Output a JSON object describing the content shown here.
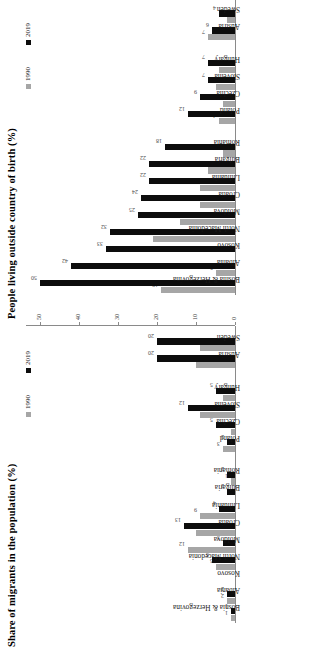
{
  "figure": {
    "orientation": "rotated-90-ccw",
    "colors": {
      "series_1990": "#a6a6a6",
      "series_2019": "#0d0d0d",
      "axis": "#8a8a8a",
      "text": "#1a1a1a"
    }
  },
  "legend": {
    "series_1990": "1990",
    "series_2019": "2019"
  },
  "chart_data": [
    {
      "type": "bar",
      "id": "people-living-outside-country-of-birth",
      "title": "People living outside country of birth (%)",
      "xlabel": "",
      "ylabel": "",
      "ylim": [
        0,
        50
      ],
      "yticks": [
        "0",
        "20",
        "40"
      ],
      "grid": false,
      "legend_position": "top-right",
      "categories": [
        "Bosnia & Herzegovina",
        "Albania",
        "Kosovo",
        "North Macedonia",
        "Moldova",
        "Croatia",
        "Lithuania",
        "Bulgaria",
        "Romania",
        "Poland",
        "Czechia",
        "Slovenia",
        "Hungary",
        "Austria",
        "Sweden"
      ],
      "group_breaks": [
        9,
        13
      ],
      "series": [
        {
          "name": "1990",
          "values": [
            19,
            5,
            null,
            21,
            14,
            9,
            9,
            7,
            3,
            4,
            3,
            5,
            4,
            7,
            2
          ]
        },
        {
          "name": "2019",
          "values": [
            50,
            42,
            33,
            32,
            25,
            24,
            22,
            22,
            18,
            12,
            9,
            7,
            7,
            6,
            4
          ]
        }
      ]
    },
    {
      "type": "bar",
      "id": "share-of-migrants-in-the-population",
      "title": "Share of migrants in the population (%)",
      "xlabel": "",
      "ylabel": "",
      "ylim": [
        0,
        50
      ],
      "yticks": [
        "0",
        "10",
        "20",
        "30",
        "40",
        "50"
      ],
      "grid": false,
      "legend_position": "top-right",
      "categories": [
        "Bosnia & Herzegovina",
        "Albania",
        "Kosovo",
        "North Macedonia",
        "Moldova",
        "Croatia",
        "Lithuania",
        "Bulgaria",
        "Romania",
        "Poland",
        "Czechia",
        "Slovenia",
        "Hungary",
        "Austria",
        "Sweden"
      ],
      "group_breaks": [
        9,
        13
      ],
      "series": [
        {
          "name": "1990",
          "values": [
            1,
            2,
            null,
            5,
            12,
            10,
            9,
            0,
            1,
            3,
            1,
            9,
            3,
            10,
            9
          ]
        },
        {
          "name": "2019",
          "values": [
            1,
            2,
            null,
            6,
            3,
            13,
            4,
            2,
            2,
            2,
            5,
            12,
            5,
            20,
            20
          ]
        }
      ]
    }
  ]
}
